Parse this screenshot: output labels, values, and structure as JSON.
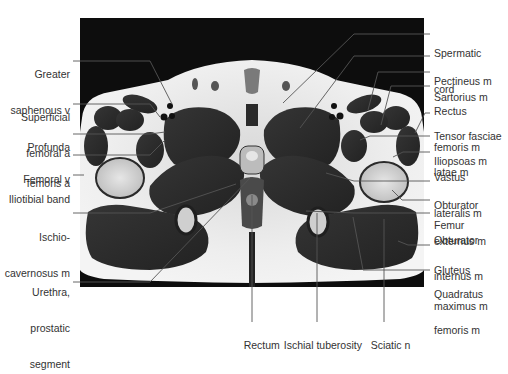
{
  "figure": {
    "type": "axial MRI cross-section, male pelvis / proximal thigh",
    "labels_left": [
      {
        "lines": [
          "Greater",
          "saphenous v"
        ],
        "x": 0,
        "y": 44,
        "w": 70,
        "target": [
          172,
          104
        ],
        "line_y": 61
      },
      {
        "lines": [
          "Superficial",
          "femoral a"
        ],
        "x": 0,
        "y": 87,
        "w": 70,
        "target": [
          160,
          117
        ],
        "line_y": 104
      },
      {
        "lines": [
          "Profunda",
          "femoris a"
        ],
        "x": 0,
        "y": 117,
        "w": 70,
        "target": [
          165,
          132
        ],
        "line_y": 134
      },
      {
        "lines": [
          "Femoral v"
        ],
        "x": 0,
        "y": 149,
        "w": 70,
        "target": [
          165,
          140
        ],
        "line_y": 155
      },
      {
        "lines": [
          "Iliotibial band"
        ],
        "x": 0,
        "y": 169,
        "w": 70,
        "target": [
          84,
          175
        ],
        "line_y": 175
      },
      {
        "lines": [
          "Ischio-",
          "cavernosus m"
        ],
        "x": 0,
        "y": 207,
        "w": 70,
        "target": [
          236,
          184
        ],
        "line_y": 213
      },
      {
        "lines": [
          "Urethra,",
          "prostatic",
          "segment"
        ],
        "x": 0,
        "y": 262,
        "w": 70,
        "target": [
          251,
          177
        ],
        "line_y": 282
      }
    ],
    "labels_right": [
      {
        "lines": [
          "Spermatic",
          "cord"
        ],
        "x": 434,
        "y": 23,
        "target": [
          283,
          103
        ],
        "line_y": 34
      },
      {
        "lines": [
          "Pectineus m"
        ],
        "x": 434,
        "y": 51,
        "target": [
          300,
          128
        ],
        "line_y": 56
      },
      {
        "lines": [
          "Sartorius m"
        ],
        "x": 434,
        "y": 67,
        "target": [
          368,
          110
        ],
        "line_y": 72
      },
      {
        "lines": [
          "Rectus",
          "femoris m"
        ],
        "x": 434,
        "y": 81,
        "target": [
          381,
          125
        ],
        "line_y": 86
      },
      {
        "lines": [
          "Tensor fasciae",
          "latae m"
        ],
        "x": 434,
        "y": 106,
        "target": [
          415,
          133
        ],
        "line_y": 113
      },
      {
        "lines": [
          "Iliopsoas m"
        ],
        "x": 434,
        "y": 131,
        "target": [
          360,
          140
        ],
        "line_y": 136
      },
      {
        "lines": [
          "Vastus",
          "lateralis m"
        ],
        "x": 434,
        "y": 147,
        "target": [
          393,
          157
        ],
        "line_y": 152
      },
      {
        "lines": [
          "Obturator",
          "externus m"
        ],
        "x": 434,
        "y": 175,
        "target": [
          326,
          173
        ],
        "line_y": 181
      },
      {
        "lines": [
          "Femur"
        ],
        "x": 434,
        "y": 195,
        "target": [
          392,
          190
        ],
        "line_y": 200
      },
      {
        "lines": [
          "Obturator",
          "internus m"
        ],
        "x": 434,
        "y": 210,
        "target": [
          306,
          211
        ],
        "line_y": 213
      },
      {
        "lines": [
          "Gluteus",
          "maximus m"
        ],
        "x": 434,
        "y": 240,
        "target": [
          398,
          241
        ],
        "line_y": 245
      },
      {
        "lines": [
          "Quadratus",
          "femoris m"
        ],
        "x": 434,
        "y": 264,
        "target": [
          353,
          217
        ],
        "line_y": 270
      }
    ],
    "labels_bottom": [
      {
        "text": "Rectus",
        "display": "Rectum",
        "cx": 252,
        "y": 327,
        "top": 195,
        "bottom": 322
      },
      {
        "text": "Ischial tuberosity",
        "display": "Ischial tuberosity",
        "cx": 317,
        "y": 327,
        "top": 213,
        "bottom": 322
      },
      {
        "text": "Sciatic n",
        "display": "Sciatic n",
        "cx": 384,
        "y": 327,
        "top": 219,
        "bottom": 322
      }
    ]
  },
  "colors": {
    "background": "#ffffff",
    "scan_black": "#0d0d0d",
    "fat": "#e8e8e8",
    "muscle": "#2e2e2e",
    "bone_marrow": "#dcdcdc",
    "leader_line": "#555555",
    "text": "#333333"
  }
}
